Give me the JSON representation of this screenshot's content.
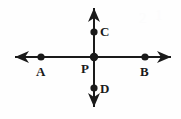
{
  "figure": {
    "background_color": "#fefefe",
    "stroke_color": "#1a1a1a",
    "label_color": "#1a1a1a",
    "width": 181,
    "height": 119,
    "lines": [
      {
        "name": "horizontal-line-AB",
        "orientation": "horizontal",
        "x1": 15,
        "y1": 57,
        "x2": 171,
        "y2": 57,
        "arrow_start": true,
        "arrow_end": true,
        "stroke_width": 2
      },
      {
        "name": "vertical-line-CD",
        "orientation": "vertical",
        "x1": 94,
        "y1": 8,
        "x2": 94,
        "y2": 107,
        "arrow_start": true,
        "arrow_end": true,
        "stroke_width": 2
      }
    ],
    "points": [
      {
        "id": "A",
        "label": "A",
        "x": 41,
        "y": 57,
        "radius": 3.6,
        "label_x": 36,
        "label_y": 65,
        "label_position": "below"
      },
      {
        "id": "P",
        "label": "P",
        "x": 94,
        "y": 57,
        "radius": 4.2,
        "label_x": 81,
        "label_y": 62,
        "label_position": "below-left"
      },
      {
        "id": "B",
        "label": "B",
        "x": 145,
        "y": 57,
        "radius": 3.6,
        "label_x": 140,
        "label_y": 65,
        "label_position": "below"
      },
      {
        "id": "C",
        "label": "C",
        "x": 94,
        "y": 32,
        "radius": 3.6,
        "label_x": 100,
        "label_y": 25,
        "label_position": "right"
      },
      {
        "id": "D",
        "label": "D",
        "x": 94,
        "y": 88,
        "radius": 3.6,
        "label_x": 100,
        "label_y": 82,
        "label_position": "right"
      }
    ],
    "artifacts": [
      {
        "name": "scan-artifact-1",
        "glyph": "2",
        "x": 139,
        "y": 10
      },
      {
        "name": "scan-artifact-2",
        "glyph": "1",
        "x": 155,
        "y": 7
      }
    ]
  }
}
